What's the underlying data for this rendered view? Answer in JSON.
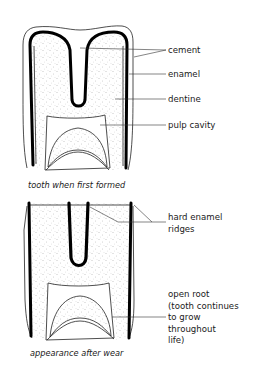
{
  "figure": {
    "top_tooth": {
      "caption": "tooth when first formed",
      "labels": {
        "cement": "cement",
        "enamel": "enamel",
        "dentine": "dentine",
        "pulp_cavity": "pulp cavity"
      }
    },
    "bottom_tooth": {
      "caption": "appearance after wear",
      "labels": {
        "ridges_line1": "hard enamel",
        "ridges_line2": "ridges",
        "root_line1": "open root",
        "root_line2": "(tooth continues",
        "root_line3": "to grow",
        "root_line4": "throughout",
        "root_line5": "life)"
      }
    },
    "colors": {
      "ink": "#000000",
      "background": "#ffffff",
      "stipple": "#8a8a8a"
    }
  }
}
